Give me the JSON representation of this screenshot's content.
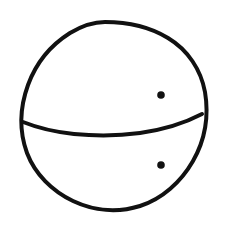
{
  "canvas": {
    "width": 226,
    "height": 231,
    "background_color": "#ffffff",
    "title": "Hand-drawn ball sketch"
  },
  "drawing": {
    "style": "hand-drawn ink sketch",
    "stroke_color": "#111111",
    "fill_color": "#111111",
    "stroke_width": 4,
    "description": "A hand-drawn circle divided by a curved horizontal line, with two small filled dots on the right side",
    "shapes": [
      {
        "name": "circle-outline",
        "type": "circle",
        "cx": 113,
        "cy": 116,
        "rx": 92,
        "ry": 94,
        "stroke_color": "#111111",
        "stroke_width": 4,
        "filled": false,
        "bounds": {
          "left": 21,
          "top": 22,
          "right": 206,
          "bottom": 211
        }
      },
      {
        "name": "divider-arc",
        "type": "arc",
        "start_x": 23,
        "start_y": 122,
        "end_x": 202,
        "end_y": 114,
        "lowest_x": 115,
        "lowest_y": 135,
        "stroke_color": "#111111",
        "stroke_width": 4,
        "filled": false
      },
      {
        "name": "upper-dot",
        "type": "dot",
        "cx": 161,
        "cy": 95,
        "r": 3.8,
        "fill_color": "#111111"
      },
      {
        "name": "lower-dot",
        "type": "dot",
        "cx": 161,
        "cy": 165,
        "r": 3.8,
        "fill_color": "#111111"
      }
    ]
  },
  "paths": {
    "circle_outline": "M 105 22 C 128 22 150 27 168 38 C 188 50 201 70 205 92 C 209 116 205 140 193 161 C 181 182 162 199 140 206 C 118 213 94 211 73 201 C 52 191 35 174 27 153 C 19 131 20 107 28 85 C 36 63 51 45 70 33 C 80 27 92 22 105 22 Z",
    "divider_arc": "M 23 122 C 38 128 55 132 74 134 C 95 136 118 136 140 133 C 161 130 181 125 202 114"
  }
}
